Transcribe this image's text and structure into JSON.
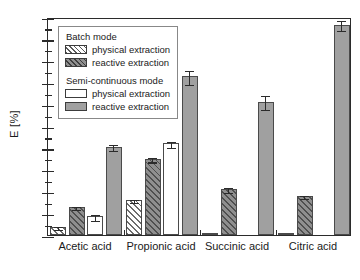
{
  "chart_data": {
    "type": "bar",
    "title": "",
    "xlabel": "",
    "ylabel": "E [%]",
    "ylim": [
      0,
      100
    ],
    "ytick_step": 10,
    "yminor_step": 5,
    "grid": false,
    "legend_position": "upper-left",
    "categories": [
      "Acetic acid",
      "Propionic acid",
      "Succinic acid",
      "Citric acid"
    ],
    "ytick_labels": [
      "0",
      "10",
      "20",
      "30",
      "40",
      "50",
      "60",
      "70",
      "80",
      "90",
      "100"
    ],
    "series": [
      {
        "name": "Batch mode — physical extraction",
        "key": "batch_physical",
        "style": "b-phys",
        "values": [
          3.8,
          16.0,
          0.3,
          0.3
        ],
        "errors": [
          0.9,
          0.8,
          0.0,
          0.0
        ]
      },
      {
        "name": "Batch mode — reactive extraction",
        "key": "batch_reactive",
        "style": "b-react",
        "values": [
          12.8,
          35.0,
          21.2,
          17.9
        ],
        "errors": [
          1.0,
          1.3,
          1.5,
          0.8
        ]
      },
      {
        "name": "Semi-continuous mode — physical extraction",
        "key": "semi_physical",
        "style": "s-phys",
        "values": [
          8.5,
          42.0,
          0.0,
          0.0
        ],
        "errors": [
          1.5,
          1.6,
          0.0,
          0.0
        ]
      },
      {
        "name": "Semi-continuous mode — reactive extraction",
        "key": "semi_reactive",
        "style": "s-react",
        "values": [
          40.6,
          72.8,
          61.2,
          96.5
        ],
        "errors": [
          1.6,
          3.5,
          3.6,
          2.6
        ]
      }
    ]
  },
  "legend": {
    "group_batch_title": "Batch mode",
    "group_semi_title": "Semi-continuous mode",
    "batch_physical_label": "physical extraction",
    "batch_reactive_label": "reactive extraction",
    "semi_physical_label": "physical extraction",
    "semi_reactive_label": "reactive extraction"
  },
  "colors": {
    "axis": "#2b2b2b",
    "bar_outline": "#4a4a4a",
    "reactive_fill": "#a0a0a0",
    "batch_reactive_fill": "#8f8f8f",
    "physical_fill": "#ffffff",
    "hatch": "#5a5a5a",
    "legend_border": "#888888",
    "text": "#1a1a1a"
  }
}
